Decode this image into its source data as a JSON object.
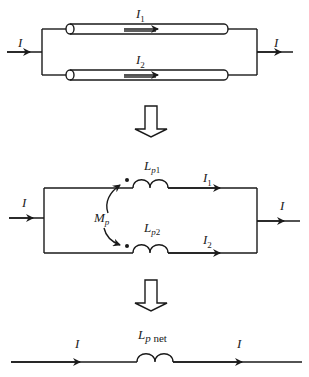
{
  "diagram": {
    "stage1": {
      "input_current": "I",
      "output_current": "I",
      "branch1": {
        "current": "I",
        "current_sub": "1"
      },
      "branch2": {
        "current": "I",
        "current_sub": "2"
      }
    },
    "stage2": {
      "input_current": "I",
      "output_current": "I",
      "mutual": {
        "symbol": "M",
        "sub": "p"
      },
      "inductor1": {
        "symbol": "L",
        "sub_italic": "p",
        "sub_num": "1",
        "current": "I",
        "current_sub": "1"
      },
      "inductor2": {
        "symbol": "L",
        "sub_italic": "p",
        "sub_num": "2",
        "current": "I",
        "current_sub": "2"
      }
    },
    "stage3": {
      "input_current": "I",
      "output_current": "I",
      "inductor": {
        "symbol": "L",
        "sub_italic": "p",
        "sub_text": " net"
      }
    },
    "colors": {
      "stroke": "#1a1a1a",
      "background": "#ffffff"
    }
  }
}
